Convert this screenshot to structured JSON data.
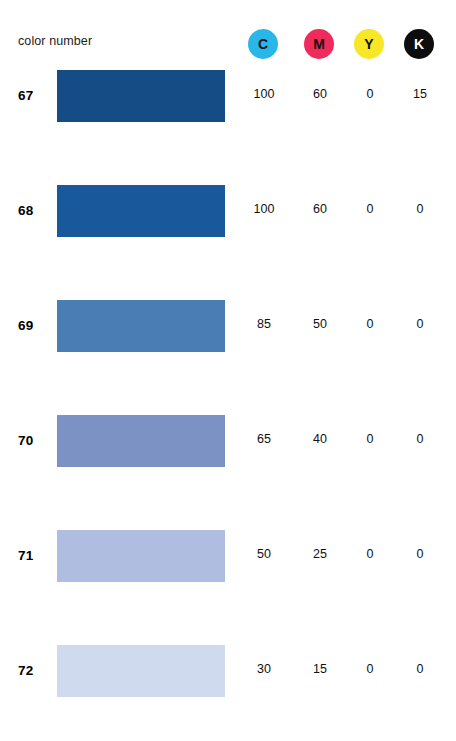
{
  "header": {
    "label": "color number",
    "ink_channels": [
      {
        "key": "C",
        "label": "C",
        "name": "cyan",
        "dot_color": "#29B6E8",
        "text_color": "#111111",
        "x": 248
      },
      {
        "key": "M",
        "label": "M",
        "name": "magenta",
        "dot_color": "#EF2B5B",
        "text_color": "#111111",
        "x": 304
      },
      {
        "key": "Y",
        "label": "Y",
        "name": "yellow",
        "dot_color": "#F7E727",
        "text_color": "#111111",
        "x": 354
      },
      {
        "key": "K",
        "label": "K",
        "name": "black",
        "dot_color": "#0D0D0D",
        "text_color": "#ffffff",
        "x": 404
      }
    ]
  },
  "chart_data": {
    "type": "table",
    "title": "color number",
    "columns": [
      "color number",
      "swatch",
      "C",
      "M",
      "Y",
      "K"
    ],
    "rows": [
      {
        "number": "67",
        "swatch_color": "#154C86",
        "c": "100",
        "m": "60",
        "y": "0",
        "k": "15"
      },
      {
        "number": "68",
        "swatch_color": "#19599B",
        "c": "100",
        "m": "60",
        "y": "0",
        "k": "0"
      },
      {
        "number": "69",
        "swatch_color": "#4B7DB5",
        "c": "85",
        "m": "50",
        "y": "0",
        "k": "0"
      },
      {
        "number": "70",
        "swatch_color": "#7D92C4",
        "c": "65",
        "m": "40",
        "y": "0",
        "k": "0"
      },
      {
        "number": "71",
        "swatch_color": "#AFBEE0",
        "c": "50",
        "m": "25",
        "y": "0",
        "k": "0"
      },
      {
        "number": "72",
        "swatch_color": "#CFDAEE",
        "c": "30",
        "m": "15",
        "y": "0",
        "k": "0"
      }
    ]
  }
}
